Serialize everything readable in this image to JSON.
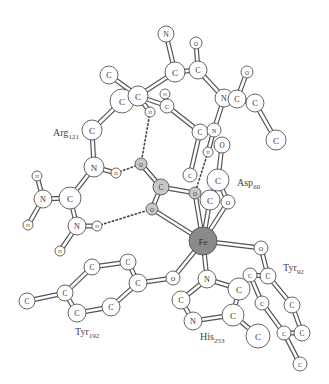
{
  "figure": {
    "type": "ball-and-stick molecular diagram",
    "colors": {
      "atom_fill": "#ffffff",
      "highlight_fill": "#c8c8c8",
      "iron_fill": "#8a8a8a",
      "outline": "#555555",
      "background": "#ffffff"
    }
  },
  "residue_labels": [
    {
      "id": "arg",
      "name": "Arg",
      "number": "121",
      "x": 53,
      "y": 136
    },
    {
      "id": "asp",
      "name": "Asp",
      "number": "60",
      "x": 237,
      "y": 186
    },
    {
      "id": "tyr92",
      "name": "Tyr",
      "number": "92",
      "x": 283,
      "y": 271
    },
    {
      "id": "tyr192",
      "name": "Tyr",
      "number": "192",
      "x": 75,
      "y": 335
    },
    {
      "id": "his",
      "name": "His",
      "number": "253",
      "x": 200,
      "y": 340
    }
  ],
  "atoms": [
    {
      "id": "n_top",
      "el": "N",
      "x": 166,
      "y": 34,
      "r": 8
    },
    {
      "id": "o_top",
      "el": "O",
      "x": 196,
      "y": 43,
      "r": 6
    },
    {
      "id": "c_a1",
      "el": "C",
      "x": 175,
      "y": 72,
      "r": 10
    },
    {
      "id": "c_a2",
      "el": "C",
      "x": 198,
      "y": 70,
      "r": 9
    },
    {
      "id": "o_r1",
      "el": "O",
      "x": 247,
      "y": 72,
      "r": 6
    },
    {
      "id": "n_r",
      "el": "N",
      "x": 224,
      "y": 98,
      "r": 9
    },
    {
      "id": "c_r1",
      "el": "C",
      "x": 237,
      "y": 99,
      "r": 9
    },
    {
      "id": "c_r2",
      "el": "C",
      "x": 255,
      "y": 103,
      "r": 9
    },
    {
      "id": "c_r3",
      "el": "C",
      "x": 276,
      "y": 140,
      "r": 10
    },
    {
      "id": "c_l1",
      "el": "C",
      "x": 109,
      "y": 75,
      "r": 9
    },
    {
      "id": "c_l2",
      "el": "C",
      "x": 122,
      "y": 101,
      "r": 12
    },
    {
      "id": "c_l3",
      "el": "C",
      "x": 138,
      "y": 96,
      "r": 10
    },
    {
      "id": "h_m1",
      "el": "H",
      "x": 165,
      "y": 94,
      "r": 5
    },
    {
      "id": "c_m1",
      "el": "C",
      "x": 167,
      "y": 106,
      "r": 7
    },
    {
      "id": "h_m2",
      "el": "H",
      "x": 150,
      "y": 112,
      "r": 5
    },
    {
      "id": "c_mid",
      "el": "C",
      "x": 200,
      "y": 132,
      "r": 8
    },
    {
      "id": "n_mid",
      "el": "N",
      "x": 214,
      "y": 130,
      "r": 7
    },
    {
      "id": "o_asp",
      "el": "O",
      "x": 222,
      "y": 145,
      "r": 8
    },
    {
      "id": "h_mid",
      "el": "H",
      "x": 208,
      "y": 152,
      "r": 5
    },
    {
      "id": "c_asp",
      "el": "C",
      "x": 218,
      "y": 180,
      "r": 11
    },
    {
      "id": "c_arg",
      "el": "C",
      "x": 92,
      "y": 130,
      "r": 10
    },
    {
      "id": "n_arg1",
      "el": "N",
      "x": 94,
      "y": 167,
      "r": 10
    },
    {
      "id": "h_arg1",
      "el": "H",
      "x": 116,
      "y": 173,
      "r": 5
    },
    {
      "id": "n_arg2",
      "el": "N",
      "x": 43,
      "y": 199,
      "r": 9
    },
    {
      "id": "c_arg2",
      "el": "C",
      "x": 70,
      "y": 198,
      "r": 11
    },
    {
      "id": "h_arg2",
      "el": "H",
      "x": 37,
      "y": 176,
      "r": 5
    },
    {
      "id": "h_arg3",
      "el": "H",
      "x": 28,
      "y": 225,
      "r": 5
    },
    {
      "id": "n_arg3",
      "el": "N",
      "x": 77,
      "y": 226,
      "r": 9
    },
    {
      "id": "h_arg4",
      "el": "H",
      "x": 97,
      "y": 226,
      "r": 5
    },
    {
      "id": "h_arg5",
      "el": "H",
      "x": 60,
      "y": 251,
      "r": 5
    },
    {
      "id": "o_c1",
      "el": "O",
      "x": 141,
      "y": 164,
      "r": 6,
      "shade": "highlight"
    },
    {
      "id": "c_carb",
      "el": "C",
      "x": 161,
      "y": 187,
      "r": 8,
      "shade": "highlight"
    },
    {
      "id": "o_c2",
      "el": "O",
      "x": 152,
      "y": 209,
      "r": 6,
      "shade": "highlight"
    },
    {
      "id": "o_c3",
      "el": "O",
      "x": 195,
      "y": 193,
      "r": 6,
      "shade": "highlight"
    },
    {
      "id": "c_low",
      "el": "C",
      "x": 190,
      "y": 175,
      "r": 7
    },
    {
      "id": "c_asp2",
      "el": "C",
      "x": 210,
      "y": 200,
      "r": 10
    },
    {
      "id": "o_asp2",
      "el": "O",
      "x": 228,
      "y": 202,
      "r": 7
    },
    {
      "id": "fe",
      "el": "Fe",
      "x": 203,
      "y": 241,
      "r": 14,
      "shade": "iron"
    },
    {
      "id": "o_tyr92",
      "el": "O",
      "x": 261,
      "y": 248,
      "r": 7
    },
    {
      "id": "o_tyr192",
      "el": "O",
      "x": 173,
      "y": 278,
      "r": 7
    },
    {
      "id": "n_his1",
      "el": "N",
      "x": 207,
      "y": 279,
      "r": 9
    },
    {
      "id": "c_his1",
      "el": "C",
      "x": 181,
      "y": 300,
      "r": 9
    },
    {
      "id": "n_his2",
      "el": "N",
      "x": 193,
      "y": 321,
      "r": 9
    },
    {
      "id": "c_his2",
      "el": "C",
      "x": 239,
      "y": 289,
      "r": 11
    },
    {
      "id": "c_his3",
      "el": "C",
      "x": 233,
      "y": 315,
      "r": 11
    },
    {
      "id": "c_his4",
      "el": "C",
      "x": 258,
      "y": 336,
      "r": 12
    },
    {
      "id": "c_t92a",
      "el": "C",
      "x": 250,
      "y": 275,
      "r": 7
    },
    {
      "id": "c_t92b",
      "el": "C",
      "x": 268,
      "y": 276,
      "r": 8
    },
    {
      "id": "c_t92c",
      "el": "C",
      "x": 262,
      "y": 303,
      "r": 7
    },
    {
      "id": "c_t92d",
      "el": "C",
      "x": 292,
      "y": 305,
      "r": 8
    },
    {
      "id": "c_t92e",
      "el": "C",
      "x": 284,
      "y": 333,
      "r": 7
    },
    {
      "id": "c_t92f",
      "el": "C",
      "x": 302,
      "y": 333,
      "r": 8
    },
    {
      "id": "c_t92g",
      "el": "C",
      "x": 300,
      "y": 364,
      "r": 7
    },
    {
      "id": "c_t192a",
      "el": "C",
      "x": 27,
      "y": 301,
      "r": 8
    },
    {
      "id": "c_t192b",
      "el": "C",
      "x": 65,
      "y": 293,
      "r": 8
    },
    {
      "id": "c_t192c",
      "el": "C",
      "x": 92,
      "y": 267,
      "r": 8
    },
    {
      "id": "c_t192d",
      "el": "C",
      "x": 128,
      "y": 262,
      "r": 8
    },
    {
      "id": "c_t192e",
      "el": "C",
      "x": 138,
      "y": 283,
      "r": 9
    },
    {
      "id": "c_t192f",
      "el": "C",
      "x": 111,
      "y": 307,
      "r": 9
    },
    {
      "id": "c_t192g",
      "el": "C",
      "x": 77,
      "y": 313,
      "r": 9
    }
  ],
  "bonds": [
    [
      "n_top",
      "c_a1"
    ],
    [
      "o_top",
      "c_a2"
    ],
    [
      "c_a1",
      "c_a2"
    ],
    [
      "c_a2",
      "n_r"
    ],
    [
      "n_r",
      "c_r1"
    ],
    [
      "c_r1",
      "o_r1"
    ],
    [
      "c_r1",
      "c_r2"
    ],
    [
      "c_r2",
      "c_r3"
    ],
    [
      "n_r",
      "n_mid"
    ],
    [
      "c_a1",
      "c_l3"
    ],
    [
      "c_l1",
      "c_l3"
    ],
    [
      "c_l2",
      "c_l3"
    ],
    [
      "c_l3",
      "c_m1"
    ],
    [
      "c_m1",
      "h_m1"
    ],
    [
      "c_m1",
      "c_mid"
    ],
    [
      "c_l3",
      "h_m2"
    ],
    [
      "c_mid",
      "n_mid"
    ],
    [
      "c_mid",
      "c_low"
    ],
    [
      "n_mid",
      "h_mid"
    ],
    [
      "o_asp",
      "c_asp"
    ],
    [
      "c_asp",
      "c_asp2"
    ],
    [
      "c_asp",
      "o_asp2"
    ],
    [
      "c_l2",
      "c_arg"
    ],
    [
      "c_arg",
      "n_arg1"
    ],
    [
      "n_arg1",
      "h_arg1"
    ],
    [
      "n_arg1",
      "c_arg2"
    ],
    [
      "c_arg2",
      "n_arg2"
    ],
    [
      "n_arg2",
      "h_arg2"
    ],
    [
      "n_arg2",
      "h_arg3"
    ],
    [
      "c_arg2",
      "n_arg3"
    ],
    [
      "n_arg3",
      "h_arg4"
    ],
    [
      "n_arg3",
      "h_arg5"
    ],
    [
      "o_c1",
      "c_carb"
    ],
    [
      "c_carb",
      "o_c2"
    ],
    [
      "c_carb",
      "o_c3"
    ],
    [
      "o_c2",
      "fe"
    ],
    [
      "o_c3",
      "fe"
    ],
    [
      "c_asp2",
      "fe"
    ],
    [
      "o_asp2",
      "fe"
    ],
    [
      "fe",
      "o_tyr92"
    ],
    [
      "fe",
      "o_tyr192"
    ],
    [
      "fe",
      "n_his1"
    ],
    [
      "n_his1",
      "c_his1"
    ],
    [
      "c_his1",
      "n_his2"
    ],
    [
      "n_his2",
      "c_his3"
    ],
    [
      "c_his3",
      "c_his2"
    ],
    [
      "c_his2",
      "n_his1"
    ],
    [
      "c_his3",
      "c_his4"
    ],
    [
      "o_tyr92",
      "c_t92b"
    ],
    [
      "c_t92a",
      "c_t92b"
    ],
    [
      "c_t92a",
      "c_t92c"
    ],
    [
      "c_t92b",
      "c_t92d"
    ],
    [
      "c_t92c",
      "c_t92e"
    ],
    [
      "c_t92d",
      "c_t92f"
    ],
    [
      "c_t92e",
      "c_t92f"
    ],
    [
      "c_t92e",
      "c_t92g"
    ],
    [
      "o_tyr192",
      "c_t192e"
    ],
    [
      "c_t192e",
      "c_t192d"
    ],
    [
      "c_t192d",
      "c_t192c"
    ],
    [
      "c_t192c",
      "c_t192b"
    ],
    [
      "c_t192b",
      "c_t192g"
    ],
    [
      "c_t192g",
      "c_t192f"
    ],
    [
      "c_t192f",
      "c_t192e"
    ],
    [
      "c_t192a",
      "c_t192b"
    ]
  ],
  "hbonds": [
    [
      "h_m2",
      "o_c1"
    ],
    [
      "h_arg1",
      "o_c1"
    ],
    [
      "h_arg4",
      "o_c2"
    ],
    [
      "h_mid",
      "o_c3"
    ]
  ]
}
